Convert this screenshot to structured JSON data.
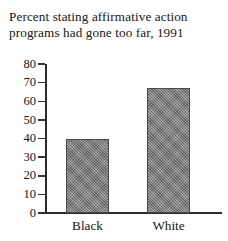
{
  "chart_data": {
    "type": "bar",
    "title": "Percent stating affirmative action\nprograms had gone too far, 1991",
    "xlabel": "",
    "ylabel": "",
    "categories": [
      "Black",
      "White"
    ],
    "values": [
      40,
      67
    ],
    "ylim": [
      0,
      80
    ],
    "yticks": [
      0,
      10,
      20,
      30,
      40,
      50,
      60,
      70,
      80
    ],
    "ytick_labels": [
      "0",
      "10",
      "20",
      "30",
      "40",
      "50",
      "60",
      "70",
      "80"
    ],
    "grid": false,
    "legend": "none",
    "series": [
      {
        "name": "Percent stating affirmative action programs had gone too far",
        "values": [
          40,
          67
        ]
      }
    ],
    "bar_color": "#7e7e7e",
    "axis_color": "#2b2b2b",
    "background_color": "#ffffff"
  }
}
